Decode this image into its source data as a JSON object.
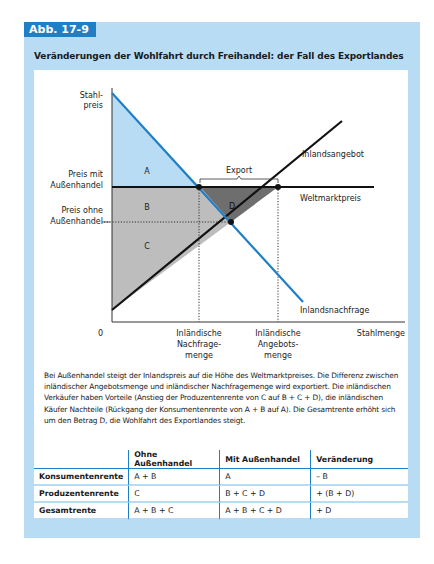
{
  "figure": {
    "tag": "Abb. 17-9",
    "title": "Veränderungen der Wohlfahrt durch Freihandel: der Fall des Exportlandes"
  },
  "colors": {
    "panel_bg": "#b9dcf5",
    "tag_bg": "#1f7fc6",
    "demand_line": "#1f7fc6",
    "area_A": "#b9dcf5",
    "area_BC": "#bdbdbd",
    "area_D": "#6e6e6e"
  },
  "diagram": {
    "y_axis_label_1": "Stahl-",
    "y_axis_label_2": "preis",
    "x_axis_label": "Stahlmenge",
    "origin_label": "0",
    "price_with_trade_1": "Preis mit",
    "price_with_trade_2": "Außenhandel",
    "price_without_trade_1": "Preis ohne",
    "price_without_trade_2": "Außenhandel",
    "supply_label": "Inlandsangebot",
    "demand_label": "Inlandsnachfrage",
    "world_price_label": "Weltmarktpreis",
    "export_label": "Export",
    "qd_label_1": "Inländische",
    "qd_label_2": "Nachfrage-",
    "qd_label_3": "menge",
    "qs_label_1": "Inländische",
    "qs_label_2": "Angebots-",
    "qs_label_3": "menge",
    "areas": {
      "A": "A",
      "B": "B",
      "C": "C",
      "D": "D"
    }
  },
  "description": "Bei Außenhandel steigt der Inlandspreis auf die Höhe des Weltmarktpreises. Die Differenz zwischen inländischer Angebotsmenge und inländischer Nachfragemenge wird exportiert. Die inländischen Verkäufer haben Vorteile (Anstieg der Produzentenrente von C auf B + C + D), die inländischen Käufer Nachteile (Rückgang der Konsumentenrente von A + B auf A). Die Gesamtrente erhöht sich um den Betrag D, die Wohlfahrt des Exportlandes steigt.",
  "table": {
    "headers": [
      "",
      "Ohne Außenhandel",
      "Mit Außenhandel",
      "Veränderung"
    ],
    "rows": [
      {
        "label": "Konsumentenrente",
        "without": "A + B",
        "with": "A",
        "change": "– B"
      },
      {
        "label": "Produzentenrente",
        "without": "C",
        "with": "B + C + D",
        "change": "+ (B + D)"
      },
      {
        "label": "Gesamtrente",
        "without": "A + B + C",
        "with": "A + B + C + D",
        "change": "+ D"
      }
    ]
  }
}
